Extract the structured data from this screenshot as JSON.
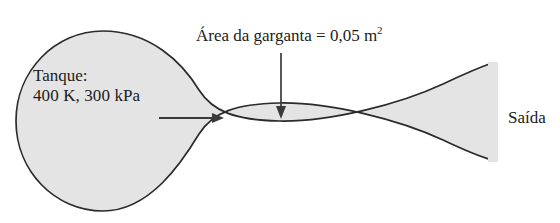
{
  "figure": {
    "name": "converging-diverging-nozzle-diagram",
    "background_color": "#ffffff",
    "body_fill_color": "#e4e4e4",
    "outline_color": "#2b2b2b",
    "text_color": "#1b1b1b"
  },
  "labels": {
    "tank_title": "Tanque:",
    "tank_conditions": "400 K, 300 kPa",
    "throat_area_text": "Área da garganta = 0,05 m",
    "throat_area_exponent": "2",
    "exit": "Saída"
  },
  "annotations": {
    "tank_temperature": "400 K",
    "tank_pressure": "300 kPa",
    "throat_area_value": "0,05",
    "throat_area_unit": "m²"
  },
  "icons": {
    "flow_arrow": "flow-direction-arrow-right",
    "throat_pointer": "throat-pointer-arrow-down"
  }
}
